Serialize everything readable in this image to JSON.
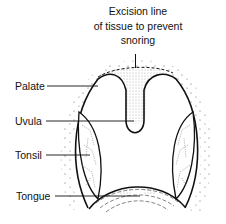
{
  "diagram": {
    "caption": {
      "lines": [
        "Excision line",
        "of tissue to prevent",
        "snoring"
      ]
    },
    "labels": {
      "palate": "Palate",
      "uvula": "Uvula",
      "tonsil": "Tonsil",
      "tongue": "Tongue"
    },
    "colors": {
      "ink": "#111111",
      "background": "#ffffff",
      "stipple": "#555555"
    }
  }
}
